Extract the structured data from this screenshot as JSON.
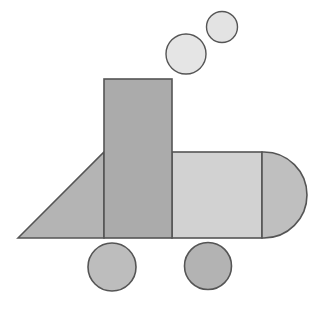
{
  "canvas": {
    "width": 316,
    "height": 312,
    "background": "#ffffff",
    "title": "Geometric shape composition"
  },
  "style": {
    "stroke_color": "#555555",
    "stroke_width": 1.6,
    "stroke_width_thin": 1.4
  },
  "shapes": {
    "smoke_small_circle": {
      "kind": "circle",
      "label": "small circle",
      "cx": 222,
      "cy": 27,
      "r": 15.5,
      "fill": "#E3E3E3"
    },
    "smoke_large_circle": {
      "kind": "circle",
      "label": "medium circle",
      "cx": 186,
      "cy": 54,
      "r": 20,
      "fill": "#E5E5E5"
    },
    "tall_rectangle": {
      "kind": "rect",
      "label": "tall vertical rectangle",
      "x": 104,
      "y": 79,
      "width": 68,
      "height": 159,
      "fill": "#ABABAB"
    },
    "left_triangle": {
      "kind": "polygon",
      "label": "right triangle",
      "points": "18,238 104,152 104,238",
      "fill": "#B4B4B4"
    },
    "body_rectangle": {
      "kind": "rect",
      "label": "horizontal body rectangle",
      "x": 172,
      "y": 152,
      "width": 90,
      "height": 86,
      "fill": "#D2D2D2"
    },
    "rounded_cap": {
      "kind": "semicircle",
      "label": "semicircular right cap",
      "path": "M 262 152 L 264 152 A 43 43 0 0 1 264 238 L 262 238 Z",
      "fill": "#BFBFBF"
    },
    "left_wheel": {
      "kind": "circle",
      "label": "left wheel circle",
      "cx": 112,
      "cy": 267,
      "r": 24,
      "fill": "#BDBDBD"
    },
    "right_wheel": {
      "kind": "circle",
      "label": "right wheel circle",
      "cx": 208,
      "cy": 266,
      "r": 23.5,
      "fill": "#B3B3B3"
    }
  }
}
